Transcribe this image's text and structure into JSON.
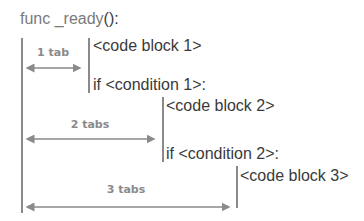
{
  "code": {
    "func_name": "func _ready",
    "func_parens": "():",
    "code_block_1": "<code block 1>",
    "condition_1": "if <condition 1>:",
    "code_block_2": "<code block 2>",
    "condition_2": "if <condition 2>:",
    "code_block_3": "<code block 3>"
  },
  "indent_labels": {
    "one": "1 tab",
    "two": "2 tabs",
    "three": "3 tabs"
  },
  "colors": {
    "text": "#3a3a3a",
    "guide": "#8a8a8a"
  }
}
